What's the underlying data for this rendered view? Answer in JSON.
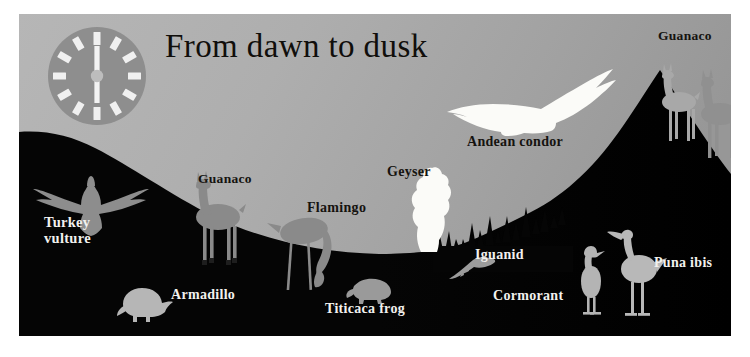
{
  "title": "From dawn to dusk",
  "clock": {
    "name": "clock-dial",
    "hour_hand": "12",
    "minute_hand": "6",
    "tick_count": 12,
    "face_color": "#8e8e8e",
    "tick_color": "#f0f0f0"
  },
  "colors": {
    "sky_light": "#b3b3b3",
    "sky_dark": "#9b9b9b",
    "ground": "#050505",
    "silhouette_gray": "#9a9a9a",
    "highlight_white": "#fbfbf8",
    "label_dark": "#15130f",
    "label_light": "#f2f1ee",
    "border": "#ffffff"
  },
  "labels": [
    {
      "id": "turkey-vulture",
      "text": "Turkey\nvulture",
      "line1": "Turkey",
      "line2": "vulture",
      "tone": "light"
    },
    {
      "id": "guanaco-left",
      "text": "Guanaco",
      "tone": "dark"
    },
    {
      "id": "armadillo",
      "text": "Armadillo",
      "tone": "light"
    },
    {
      "id": "flamingo",
      "text": "Flamingo",
      "tone": "dark"
    },
    {
      "id": "geyser",
      "text": "Geyser",
      "tone": "dark"
    },
    {
      "id": "titicaca-frog",
      "text": "Titicaca frog",
      "tone": "light"
    },
    {
      "id": "iguanid",
      "text": "Iguanid",
      "tone": "light"
    },
    {
      "id": "cormorant",
      "text": "Cormorant",
      "tone": "light"
    },
    {
      "id": "puna-ibis",
      "text": "Puna ibis",
      "tone": "light"
    },
    {
      "id": "andean-condor",
      "text": "Andean condor",
      "tone": "dark"
    },
    {
      "id": "guanaco-right",
      "text": "Guanaco",
      "tone": "dark"
    }
  ],
  "label_text": {
    "turkey_vulture_line1": "Turkey",
    "turkey_vulture_line2": "vulture",
    "guanaco_left": "Guanaco",
    "armadillo": "Armadillo",
    "flamingo": "Flamingo",
    "geyser": "Geyser",
    "titicaca_frog": "Titicaca frog",
    "iguanid": "Iguanid",
    "cormorant": "Cormorant",
    "puna_ibis": "Puna ibis",
    "andean_condor": "Andean condor",
    "guanaco_right": "Guanaco"
  },
  "figures": [
    {
      "name": "turkey-vulture-silhouette",
      "tone": "gray"
    },
    {
      "name": "guanaco-left-silhouette",
      "tone": "gray"
    },
    {
      "name": "armadillo-silhouette",
      "tone": "gray"
    },
    {
      "name": "flamingo-silhouette",
      "tone": "gray"
    },
    {
      "name": "geyser-plume",
      "tone": "white"
    },
    {
      "name": "titicaca-frog-silhouette",
      "tone": "gray"
    },
    {
      "name": "iguanid-silhouette",
      "tone": "gray"
    },
    {
      "name": "cormorant-silhouette",
      "tone": "gray"
    },
    {
      "name": "puna-ibis-silhouette",
      "tone": "gray"
    },
    {
      "name": "andean-condor-silhouette",
      "tone": "white"
    },
    {
      "name": "guanaco-right-pair-silhouette",
      "tone": "gray"
    },
    {
      "name": "grass-tufts",
      "tone": "black"
    },
    {
      "name": "mountain-left-slope",
      "tone": "black"
    },
    {
      "name": "mountain-right-peak",
      "tone": "black"
    }
  ]
}
